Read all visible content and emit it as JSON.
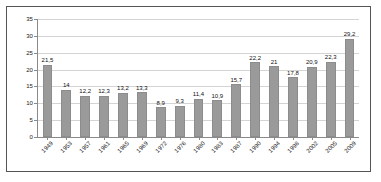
{
  "chart_data": {
    "type": "bar",
    "title": "",
    "subtitle": "",
    "xlabel": "",
    "ylabel": "",
    "ylim": [
      0,
      35
    ],
    "yticks": [
      0,
      5,
      10,
      15,
      20,
      25,
      30,
      35
    ],
    "ytick_labels": [
      "0",
      "5",
      "10",
      "15",
      "20",
      "25",
      "30",
      "35"
    ],
    "grid": true,
    "grid_axis": "y",
    "legend": false,
    "legend_position": "none",
    "decimal_separator": ",",
    "bar_color": "#9a9a9a",
    "gridline_color": "#d4d4d4",
    "axis_color": "#8a8a8a",
    "categories": [
      "1949",
      "1953",
      "1957",
      "1961",
      "1965",
      "1969",
      "1972",
      "1976",
      "1980",
      "1983",
      "1987",
      "1990",
      "1994",
      "1998",
      "2002",
      "2005",
      "2009"
    ],
    "values": [
      21.5,
      14.0,
      12.2,
      12.3,
      13.2,
      13.3,
      8.9,
      9.3,
      11.4,
      10.9,
      15.7,
      22.2,
      21.0,
      17.8,
      20.9,
      22.3,
      29.2
    ],
    "data_labels": [
      "21,5",
      "14",
      "12,2",
      "12,3",
      "13,2",
      "13,3",
      "8,9",
      "9,3",
      "11,4",
      "10,9",
      "15,7",
      "22,2",
      "21",
      "17,8",
      "20,9",
      "22,3",
      "29,2"
    ]
  }
}
